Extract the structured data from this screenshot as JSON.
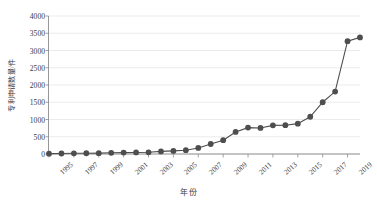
{
  "chart_data": {
    "type": "line",
    "title": "",
    "xlabel": "年份",
    "ylabel": "专利申请数量/件",
    "x": [
      1995,
      1996,
      1997,
      1998,
      1999,
      2000,
      2001,
      2002,
      2003,
      2004,
      2005,
      2006,
      2007,
      2008,
      2009,
      2010,
      2011,
      2012,
      2013,
      2014,
      2015,
      2016,
      2017,
      2018,
      2019,
      2020
    ],
    "values": [
      10,
      15,
      20,
      22,
      25,
      35,
      40,
      45,
      50,
      75,
      90,
      110,
      175,
      290,
      400,
      640,
      765,
      755,
      830,
      835,
      880,
      1080,
      1500,
      1810,
      3270,
      3380
    ],
    "categories": [
      "1995",
      "1996",
      "1997",
      "1998",
      "1999",
      "2000",
      "2001",
      "2002",
      "2003",
      "2004",
      "2005",
      "2006",
      "2007",
      "2008",
      "2009",
      "2010",
      "2011",
      "2012",
      "2013",
      "2014",
      "2015",
      "2016",
      "2017",
      "2018",
      "2019",
      "2020"
    ],
    "series": [
      {
        "name": "专利申请数量",
        "values": [
          10,
          15,
          20,
          22,
          25,
          35,
          40,
          45,
          50,
          75,
          90,
          110,
          175,
          290,
          400,
          640,
          765,
          755,
          830,
          835,
          880,
          1080,
          1500,
          1810,
          3270,
          3380
        ]
      }
    ],
    "xlim": [
      1995,
      2020
    ],
    "ylim": [
      0,
      4000
    ],
    "ytick_labels": [
      "0",
      "500",
      "1000",
      "1500",
      "2000",
      "2500",
      "3000",
      "3500",
      "4000"
    ],
    "ytick_values": [
      0,
      500,
      1000,
      1500,
      2000,
      2500,
      3000,
      3500,
      4000
    ],
    "xtick_labels": [
      "1995",
      "1997",
      "1999",
      "2001",
      "2003",
      "2005",
      "2007",
      "2009",
      "2011",
      "2013",
      "2015",
      "2017",
      "2019"
    ],
    "xtick_values": [
      1995,
      1997,
      1999,
      2001,
      2003,
      2005,
      2007,
      2009,
      2011,
      2013,
      2015,
      2017,
      2019
    ],
    "grid": true,
    "legend": false,
    "legend_position": "none",
    "marker": "circle",
    "colors": {
      "line": "#4e4e4e",
      "marker": "#4e4e4e",
      "grid": "#e2e2e2",
      "axis": "#8b8b8b",
      "text": "#3b3b3b",
      "background": "#ffffff"
    }
  }
}
